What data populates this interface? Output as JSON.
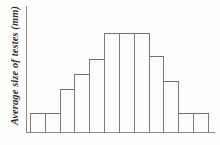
{
  "figure": {
    "ylabel": "Average size of testes (mm)",
    "xlabel": "",
    "title": "",
    "line_color": "#7b7b7b",
    "axis_color": "#8d8d8d",
    "background_color": "#fdfdfb"
  },
  "chart_data": {
    "type": "bar",
    "title": "",
    "xlabel": "",
    "ylabel": "Average size of testes (mm)",
    "categories": [
      "1",
      "2",
      "3",
      "4",
      "5",
      "6",
      "7",
      "8",
      "9",
      "10",
      "11",
      "12"
    ],
    "values": [
      16,
      16,
      35,
      47,
      59,
      79,
      79,
      79,
      61,
      41,
      16,
      16
    ],
    "ylim": [
      0,
      100
    ],
    "xlim": [
      0,
      12
    ],
    "grid": false,
    "legend": null,
    "tick_labels_x": [],
    "tick_labels_y": []
  }
}
